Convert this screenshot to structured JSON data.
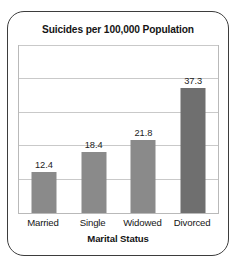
{
  "card": {
    "border_color": "#3d3d3d",
    "background": "#ffffff"
  },
  "chart_data": {
    "type": "bar",
    "title": "Suicides per 100,000 Population",
    "xlabel": "Marital Status",
    "ylabel": "",
    "categories": [
      "Married",
      "Single",
      "Widowed",
      "Divorced"
    ],
    "values": [
      12.4,
      18.4,
      21.8,
      37.3
    ],
    "value_labels": [
      "12.4",
      "18.4",
      "21.8",
      "37.3"
    ],
    "bar_colors": [
      "#8a8a8a",
      "#8a8a8a",
      "#8a8a8a",
      "#6f6f6f"
    ],
    "ylim": [
      0,
      50
    ],
    "grid": true,
    "gridlines": [
      10,
      20,
      30,
      40,
      50
    ],
    "y_tick_labels": [],
    "legend": null,
    "legend_position": "none",
    "axis_line_color": "#b9b9b9",
    "grid_color": "#c9c9c9"
  }
}
